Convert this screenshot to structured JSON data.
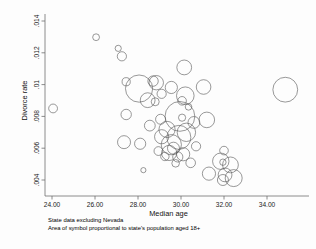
{
  "figure": {
    "background_color": "#fdfdfd",
    "symbol_stroke_color": "#5a5a5a",
    "axis_color": "#6f6f6f"
  },
  "notes": {
    "line1": "State data excluding Nevada",
    "line2": "Area of symbol proportional to state's population aged 18+"
  },
  "chart_data": {
    "type": "scatter",
    "title": "",
    "subtitle": "",
    "xlabel": "Median age",
    "ylabel": "Divorce rate",
    "xlim": [
      23.5,
      35.4
    ],
    "ylim": [
      0.0036,
      0.01435
    ],
    "grid": false,
    "legend": null,
    "xticks": [
      24.0,
      26.0,
      28.0,
      30.0,
      32.0,
      34.0
    ],
    "xticklabels": [
      "24.00",
      "26.00",
      "28.00",
      "30.00",
      "32.00",
      "34.00"
    ],
    "yticks": [
      0.004,
      0.006,
      0.008,
      0.01,
      0.012,
      0.014
    ],
    "yticklabels": [
      ".004",
      ".006",
      ".008",
      ".01",
      ".012",
      ".014"
    ],
    "size_encoding": "Area of symbol proportional to state's population aged 18+",
    "points": [
      {
        "x": 24.05,
        "y": 0.0085,
        "r": 4.4
      },
      {
        "x": 26.05,
        "y": 0.01298,
        "r": 3.4
      },
      {
        "x": 27.08,
        "y": 0.01228,
        "r": 3.1
      },
      {
        "x": 27.25,
        "y": 0.01178,
        "r": 4.6
      },
      {
        "x": 30.15,
        "y": 0.01108,
        "r": 7.4
      },
      {
        "x": 27.45,
        "y": 0.01018,
        "r": 4.1
      },
      {
        "x": 28.7,
        "y": 0.01022,
        "r": 5.2
      },
      {
        "x": 28.85,
        "y": 0.01012,
        "r": 7.2
      },
      {
        "x": 28.05,
        "y": 0.00975,
        "r": 13.6
      },
      {
        "x": 29.55,
        "y": 0.00982,
        "r": 6.1
      },
      {
        "x": 31.05,
        "y": 0.00985,
        "r": 7.3
      },
      {
        "x": 34.85,
        "y": 0.00968,
        "r": 12.4
      },
      {
        "x": 29.1,
        "y": 0.00942,
        "r": 4.6
      },
      {
        "x": 30.2,
        "y": 0.0093,
        "r": 8.8
      },
      {
        "x": 28.45,
        "y": 0.00902,
        "r": 7.4
      },
      {
        "x": 28.8,
        "y": 0.00892,
        "r": 4.0
      },
      {
        "x": 30.05,
        "y": 0.00898,
        "r": 4.3
      },
      {
        "x": 27.45,
        "y": 0.00812,
        "r": 5.2
      },
      {
        "x": 29.95,
        "y": 0.008,
        "r": 14.9
      },
      {
        "x": 30.05,
        "y": 0.00792,
        "r": 3.6
      },
      {
        "x": 31.2,
        "y": 0.00778,
        "r": 7.8
      },
      {
        "x": 30.6,
        "y": 0.00762,
        "r": 5.9
      },
      {
        "x": 29.35,
        "y": 0.00718,
        "r": 8.1
      },
      {
        "x": 30.25,
        "y": 0.007,
        "r": 9.2
      },
      {
        "x": 29.1,
        "y": 0.00672,
        "r": 7.1
      },
      {
        "x": 29.9,
        "y": 0.00668,
        "r": 12.0
      },
      {
        "x": 27.35,
        "y": 0.00638,
        "r": 6.5
      },
      {
        "x": 28.1,
        "y": 0.00628,
        "r": 5.6
      },
      {
        "x": 29.55,
        "y": 0.00622,
        "r": 10.1
      },
      {
        "x": 30.7,
        "y": 0.00612,
        "r": 4.6
      },
      {
        "x": 28.95,
        "y": 0.00582,
        "r": 4.4
      },
      {
        "x": 29.45,
        "y": 0.0057,
        "r": 7.6
      },
      {
        "x": 30.1,
        "y": 0.00562,
        "r": 6.6
      },
      {
        "x": 29.25,
        "y": 0.00548,
        "r": 4.2
      },
      {
        "x": 29.85,
        "y": 0.00545,
        "r": 5.1
      },
      {
        "x": 32.0,
        "y": 0.00585,
        "r": 4.3
      },
      {
        "x": 31.85,
        "y": 0.00518,
        "r": 8.2
      },
      {
        "x": 31.95,
        "y": 0.00512,
        "r": 3.2
      },
      {
        "x": 32.3,
        "y": 0.00495,
        "r": 7.9
      },
      {
        "x": 28.25,
        "y": 0.00462,
        "r": 2.6
      },
      {
        "x": 31.3,
        "y": 0.0044,
        "r": 6.6
      },
      {
        "x": 32.05,
        "y": 0.00432,
        "r": 6.9
      },
      {
        "x": 32.45,
        "y": 0.00412,
        "r": 8.5
      },
      {
        "x": 31.95,
        "y": 0.004,
        "r": 5.5
      },
      {
        "x": 29.65,
        "y": 0.006,
        "r": 6.0
      },
      {
        "x": 30.35,
        "y": 0.0086,
        "r": 3.3
      },
      {
        "x": 29.05,
        "y": 0.00782,
        "r": 5.0
      },
      {
        "x": 30.45,
        "y": 0.00508,
        "r": 4.8
      },
      {
        "x": 29.75,
        "y": 0.00505,
        "r": 3.8
      },
      {
        "x": 28.55,
        "y": 0.00742,
        "r": 5.4
      }
    ]
  }
}
